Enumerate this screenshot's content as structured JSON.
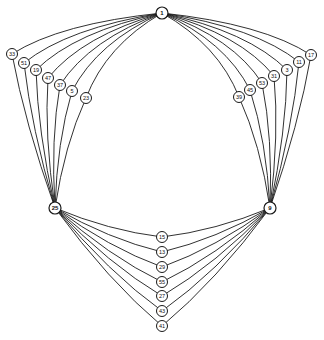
{
  "diagram": {
    "type": "graph",
    "stroke_color": "#1a1a1a",
    "background": "#ffffff",
    "hubs": {
      "top": {
        "label": "1",
        "x": 162,
        "y": 13
      },
      "left": {
        "label": "25",
        "x": 55,
        "y": 208
      },
      "right": {
        "label": "9",
        "x": 270,
        "y": 208
      }
    },
    "left_arc_nodes": [
      {
        "label": "33",
        "x": 12,
        "y": 54
      },
      {
        "label": "51",
        "x": 24,
        "y": 63
      },
      {
        "label": "19",
        "x": 36,
        "y": 70
      },
      {
        "label": "47",
        "x": 48,
        "y": 78
      },
      {
        "label": "37",
        "x": 60,
        "y": 85
      },
      {
        "label": "5",
        "x": 72,
        "y": 91
      },
      {
        "label": "23",
        "x": 86,
        "y": 98
      }
    ],
    "right_arc_nodes": [
      {
        "label": "39",
        "x": 239,
        "y": 97
      },
      {
        "label": "45",
        "x": 250,
        "y": 90
      },
      {
        "label": "53",
        "x": 262,
        "y": 83
      },
      {
        "label": "31",
        "x": 274,
        "y": 76
      },
      {
        "label": "3",
        "x": 287,
        "y": 70
      },
      {
        "label": "11",
        "x": 299,
        "y": 62
      },
      {
        "label": "17",
        "x": 311,
        "y": 55
      }
    ],
    "bottom_arc_nodes": [
      {
        "label": "15",
        "x": 162,
        "y": 237
      },
      {
        "label": "13",
        "x": 162,
        "y": 252
      },
      {
        "label": "29",
        "x": 162,
        "y": 267
      },
      {
        "label": "55",
        "x": 162,
        "y": 282
      },
      {
        "label": "27",
        "x": 162,
        "y": 296
      },
      {
        "label": "43",
        "x": 162,
        "y": 311
      },
      {
        "label": "41",
        "x": 162,
        "y": 326
      }
    ]
  }
}
